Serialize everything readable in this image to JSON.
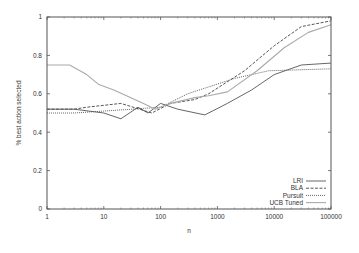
{
  "chart_data": {
    "type": "line",
    "title": "",
    "xlabel": "n",
    "ylabel": "% best action selected",
    "xscale": "log",
    "xlim": [
      1,
      100000
    ],
    "ylim": [
      0,
      1
    ],
    "xticks": [
      1,
      10,
      100,
      1000,
      10000,
      100000
    ],
    "xtick_labels": [
      "1",
      "10",
      "100",
      "1000",
      "10000",
      "100000"
    ],
    "yticks": [
      0,
      0.2,
      0.4,
      0.6,
      0.8,
      1
    ],
    "ytick_labels": [
      "0",
      "0.2",
      "0.4",
      "0.6",
      "0.8",
      "1"
    ],
    "grid": false,
    "legend_position": "bottom-right",
    "series": [
      {
        "name": "LRI",
        "style": "solid",
        "color": "#555555",
        "x": [
          1,
          3,
          10,
          20,
          40,
          60,
          100,
          200,
          600,
          1500,
          4000,
          10000,
          30000,
          100000
        ],
        "y": [
          0.52,
          0.52,
          0.5,
          0.47,
          0.53,
          0.5,
          0.55,
          0.52,
          0.49,
          0.55,
          0.62,
          0.7,
          0.75,
          0.76
        ]
      },
      {
        "name": "BLA",
        "style": "dashed",
        "color": "#444444",
        "x": [
          1,
          3,
          5,
          20,
          70,
          150,
          400,
          700,
          3000,
          10000,
          30000,
          100000
        ],
        "y": [
          0.52,
          0.52,
          0.53,
          0.55,
          0.5,
          0.55,
          0.57,
          0.6,
          0.72,
          0.85,
          0.95,
          0.98
        ]
      },
      {
        "name": "Pursuit",
        "style": "dotted",
        "color": "#555555",
        "x": [
          1,
          3,
          10,
          100,
          300,
          2000,
          8000,
          100000
        ],
        "y": [
          0.5,
          0.5,
          0.51,
          0.53,
          0.6,
          0.68,
          0.72,
          0.73
        ]
      },
      {
        "name": "UCB Tuned",
        "style": "solid-light",
        "color": "#aaaaaa",
        "x": [
          1,
          2.5,
          5,
          8,
          15,
          30,
          50,
          80,
          150,
          400,
          700,
          1500,
          5000,
          15000,
          40000,
          100000
        ],
        "y": [
          0.75,
          0.75,
          0.7,
          0.65,
          0.62,
          0.58,
          0.55,
          0.52,
          0.55,
          0.58,
          0.59,
          0.61,
          0.72,
          0.84,
          0.92,
          0.96
        ]
      }
    ]
  }
}
